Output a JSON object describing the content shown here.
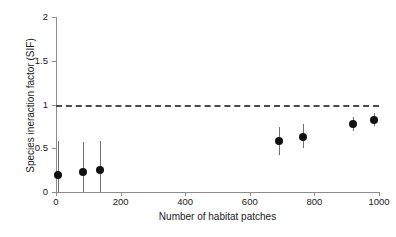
{
  "chart_data": {
    "type": "scatter",
    "title": "",
    "xlabel": "Number of habitat patches",
    "ylabel": "Species ineraction factor (SIF)",
    "xlim": [
      0,
      1000
    ],
    "ylim": [
      0,
      2
    ],
    "xticks": [
      0,
      200,
      400,
      600,
      800,
      1000
    ],
    "xtick_labels": [
      "0",
      "200",
      "400",
      "600",
      "800",
      "1000"
    ],
    "yticks": [
      0,
      0.5,
      1,
      1.5,
      2
    ],
    "ytick_labels": [
      "0",
      "0.5",
      "1",
      "1.5",
      "2"
    ],
    "grid": false,
    "legend": null,
    "marker_color": "#111111",
    "errorbar_color": "#6f6f6f",
    "reference_line": {
      "orientation": "horizontal",
      "y": 1,
      "style": "dashed",
      "color": "#4a4a4a",
      "label": ""
    },
    "points": [
      {
        "x": 5,
        "y": 0.2,
        "y_low": 0.0,
        "y_high": 0.58
      },
      {
        "x": 85,
        "y": 0.23,
        "y_low": 0.0,
        "y_high": 0.57
      },
      {
        "x": 137,
        "y": 0.25,
        "y_low": 0.0,
        "y_high": 0.58
      },
      {
        "x": 690,
        "y": 0.58,
        "y_low": 0.42,
        "y_high": 0.74
      },
      {
        "x": 765,
        "y": 0.63,
        "y_low": 0.5,
        "y_high": 0.78
      },
      {
        "x": 920,
        "y": 0.78,
        "y_low": 0.7,
        "y_high": 0.86
      },
      {
        "x": 985,
        "y": 0.82,
        "y_low": 0.75,
        "y_high": 0.9
      }
    ],
    "series": [
      {
        "name": "Species interaction factor",
        "x": [
          5,
          85,
          137,
          690,
          765,
          920,
          985
        ],
        "values": [
          0.2,
          0.23,
          0.25,
          0.58,
          0.63,
          0.78,
          0.82
        ],
        "err_low": [
          0.0,
          0.0,
          0.0,
          0.42,
          0.5,
          0.7,
          0.75
        ],
        "err_high": [
          0.58,
          0.57,
          0.58,
          0.74,
          0.78,
          0.86,
          0.9
        ]
      }
    ]
  }
}
